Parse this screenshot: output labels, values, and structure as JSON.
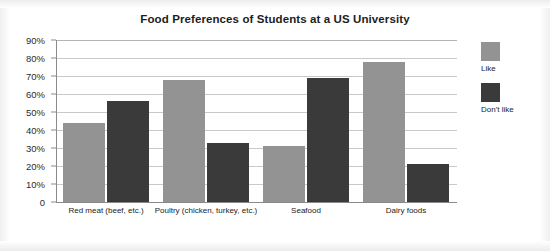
{
  "chart_data": {
    "type": "bar",
    "title": "Food Preferences of Students at a US University",
    "xlabel": "",
    "ylabel": "",
    "ylim": [
      0,
      90
    ],
    "ytick_labels": [
      "90%",
      "80%",
      "70%",
      "60%",
      "50%",
      "40%",
      "30%",
      "20%",
      "10%",
      "0"
    ],
    "yticks": [
      90,
      80,
      70,
      60,
      50,
      40,
      30,
      20,
      10,
      0
    ],
    "grid": true,
    "legend_position": "right",
    "categories": [
      "Red meat (beef, etc.)",
      "Poultry (chicken, turkey, etc.)",
      "Seafood",
      "Dairy foods"
    ],
    "series": [
      {
        "name": "Like",
        "color": "#939393",
        "values": [
          44,
          68,
          31,
          78
        ]
      },
      {
        "name": "Don't like",
        "color": "#3a3a3a",
        "values": [
          56,
          33,
          69,
          21
        ]
      }
    ]
  },
  "legend": {
    "items": [
      {
        "label": "Like",
        "color": "#939393"
      },
      {
        "label": "Don't like",
        "color": "#3a3a3a"
      }
    ]
  }
}
